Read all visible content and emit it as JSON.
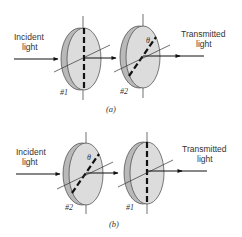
{
  "panels": [
    {
      "caption": "(a)",
      "incident_label": [
        "Incident",
        "light"
      ],
      "transmitted_label": [
        "Transmitted",
        "light"
      ],
      "polarizers": [
        {
          "label": "#1",
          "axis": "vertical"
        },
        {
          "label": "#2",
          "axis": "tilted",
          "angle_label": "θ"
        }
      ]
    },
    {
      "caption": "(b)",
      "incident_label": [
        "Incident",
        "light"
      ],
      "transmitted_label": [
        "Transmitted",
        "light"
      ],
      "polarizers": [
        {
          "label": "#2",
          "axis": "tilted",
          "angle_label": "θ"
        },
        {
          "label": "#1",
          "axis": "vertical"
        }
      ]
    }
  ],
  "colors": {
    "disc_face": "#dcdcdc",
    "disc_edge": "#b5b5b5",
    "line": "#111111"
  }
}
